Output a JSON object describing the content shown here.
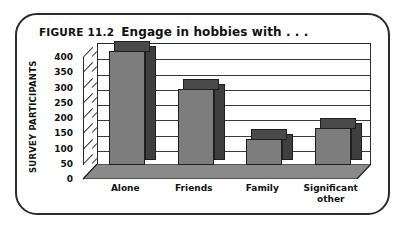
{
  "figure": {
    "number": "FIGURE 11.2",
    "title": "Engage in hobbies with . . ."
  },
  "chart_data": {
    "type": "bar",
    "title": "Engage in hobbies with . . .",
    "xlabel": "",
    "ylabel": "SURVEY PARTICIPANTS",
    "categories": [
      "Alone",
      "Friends",
      "Family",
      "Significant other"
    ],
    "category_lines": [
      [
        "Alone"
      ],
      [
        "Friends"
      ],
      [
        "Family"
      ],
      [
        "Significant",
        "other"
      ]
    ],
    "values": [
      375,
      250,
      85,
      120
    ],
    "ylim": [
      0,
      400
    ],
    "yticks": [
      0,
      50,
      100,
      150,
      200,
      250,
      300,
      350,
      400
    ],
    "ytick_labels": [
      "0",
      "50",
      "100",
      "150",
      "200",
      "250",
      "300",
      "350",
      "400"
    ],
    "grid": true,
    "legend": "none",
    "style": "3d-bar",
    "bar_front_color": "#7d7d7d",
    "bar_side_color": "#3f3f3f",
    "bar_top_color": "#4a4a4a",
    "axis_color": "#2b2b2b",
    "frame_color": "#2b2b2b",
    "background": "#ffffff"
  }
}
